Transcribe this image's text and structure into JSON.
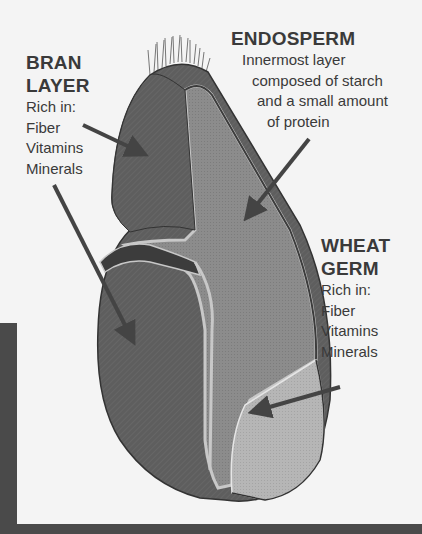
{
  "diagram": {
    "labels": {
      "bran": {
        "title_lines": [
          "BRAN",
          "LAYER"
        ],
        "body_lines": [
          "Rich in:",
          "Fiber",
          "Vitamins",
          "Minerals"
        ]
      },
      "endosperm": {
        "title_lines": [
          "ENDOSPERM"
        ],
        "body_lines": [
          "Innermost layer",
          "composed of starch",
          "and a small amount",
          "of protein"
        ]
      },
      "germ": {
        "title_lines": [
          "WHEAT",
          "GERM"
        ],
        "body_lines": [
          "Rich in:",
          "Fiber",
          "Vitamins",
          "Minerals"
        ]
      }
    },
    "colors": {
      "background": "#f4f4f4",
      "text": "#3a3a3a",
      "bran": "#5e5e5e",
      "endosperm": "#8c8c8c",
      "germ": "#b4b4b4",
      "layer_dark": "#3c3c3c",
      "layer_light": "#c8c8c8",
      "arrow": "#444444",
      "frame": "#4a4a4a"
    }
  }
}
